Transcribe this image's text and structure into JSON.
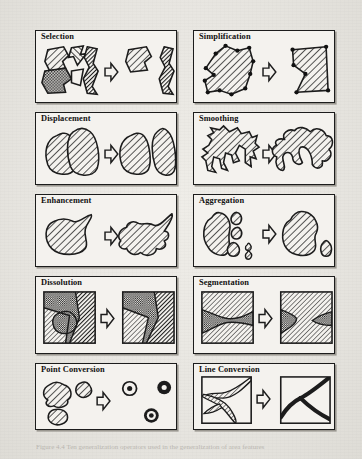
{
  "figure": {
    "caption": "Figure 4.4 Ten generalization operators used in the generalization of area features",
    "background_color": "#e9e7e2",
    "panel_fill_color": "#f4f2ee",
    "ink_color": "#1c1c1c",
    "columns": 2,
    "rows": 5,
    "panels": [
      {
        "id": "selection",
        "label": "Selection",
        "row": 1,
        "col": 1,
        "before_description": "Cluster of five hatched and checkered polygons",
        "after_description": "Two retained polygons, others removed",
        "arrow": "right-arrow-outline"
      },
      {
        "id": "simplification",
        "label": "Simplification",
        "row": 1,
        "col": 2,
        "before_description": "Hatched polygon with many vertex dots along a complex outline",
        "after_description": "Same polygon reduced to few vertices, straighter edges",
        "arrow": "right-arrow-outline"
      },
      {
        "id": "displacement",
        "label": "Displacement",
        "row": 2,
        "col": 1,
        "before_description": "Two hatched blobs overlapping / touching",
        "after_description": "Same two blobs moved apart with a visible gap",
        "arrow": "right-arrow-outline"
      },
      {
        "id": "smoothing",
        "label": "Smoothing",
        "row": 2,
        "col": 2,
        "before_description": "Hatched polygon with jagged saw-tooth boundary",
        "after_description": "Same polygon with rounded, smoothed boundary",
        "arrow": "right-arrow-outline"
      },
      {
        "id": "enhancement",
        "label": "Enhancement",
        "row": 3,
        "col": 1,
        "before_description": "Simple smooth hatched blob with a pointed spur",
        "after_description": "Blob with exaggerated, added boundary detail",
        "arrow": "right-arrow-outline"
      },
      {
        "id": "aggregation",
        "label": "Aggregation",
        "row": 3,
        "col": 2,
        "before_description": "One large hatched polygon with several small satellite polygons",
        "after_description": "Satellites merged into one larger polygon, one small outlier remains",
        "arrow": "right-arrow-outline"
      },
      {
        "id": "dissolution",
        "label": "Dissolution",
        "row": 4,
        "col": 1,
        "before_description": "Map square with a checkered area nested inside a hatched region",
        "after_description": "Map square where the small area has been dissolved into its neighbours",
        "arrow": "right-arrow-outline"
      },
      {
        "id": "segmentation",
        "label": "Segmentation",
        "row": 4,
        "col": 2,
        "before_description": "Map square with one checkered band pinched in the middle",
        "after_description": "Map square where the band is split into two separate parts",
        "arrow": "right-arrow-outline"
      },
      {
        "id": "point-conversion",
        "label": "Point Conversion",
        "row": 5,
        "col": 1,
        "before_description": "Three small hatched area polygons",
        "after_description": "Three point symbols (circles with centre dots)",
        "arrow": "right-arrow-outline"
      },
      {
        "id": "line-conversion",
        "label": "Line Conversion",
        "row": 5,
        "col": 2,
        "before_description": "Map square with a narrow branching hatched river area",
        "after_description": "Map square with the river drawn as thick black lines",
        "arrow": "right-arrow-outline"
      }
    ]
  }
}
